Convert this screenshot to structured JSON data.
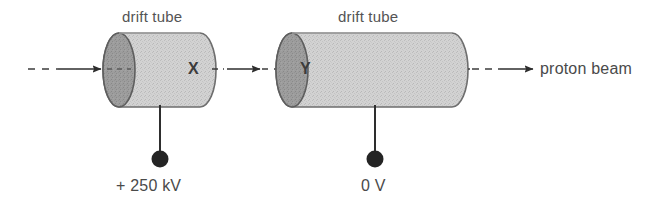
{
  "diagram": {
    "colors": {
      "tube_body": "#cfcfcf",
      "tube_face": "#9a9a9a",
      "outline": "#6e6e6e",
      "line": "#3c3c3c",
      "text": "#4a4a4a",
      "terminal": "#262626",
      "background": "#ffffff"
    },
    "tubes": [
      {
        "id": "tube-x",
        "label": "drift tube",
        "node_label": "X",
        "voltage_label": "+ 250 kV"
      },
      {
        "id": "tube-y",
        "label": "drift tube",
        "node_label": "Y",
        "voltage_label": "0 V"
      }
    ],
    "beam": {
      "label": "proton beam",
      "style": "dashed-with-arrowhead"
    },
    "icons": {
      "arrow": "arrow-right-icon",
      "terminal": "terminal-dot-icon"
    }
  }
}
